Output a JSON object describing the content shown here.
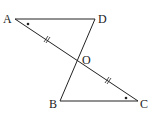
{
  "diagram": {
    "type": "geometry",
    "points": {
      "A": {
        "label": "A",
        "x": 15,
        "y": 19
      },
      "D": {
        "label": "D",
        "x": 95,
        "y": 19
      },
      "O": {
        "label": "O",
        "x": 78,
        "y": 60
      },
      "B": {
        "label": "B",
        "x": 60,
        "y": 101
      },
      "C": {
        "label": "C",
        "x": 138,
        "y": 101
      }
    },
    "segments": [
      "AD",
      "AC",
      "DB",
      "BC"
    ],
    "equal_marks": [
      "AO",
      "OC"
    ],
    "angle_marks": [
      "A",
      "C"
    ],
    "line_color": "#222222"
  }
}
